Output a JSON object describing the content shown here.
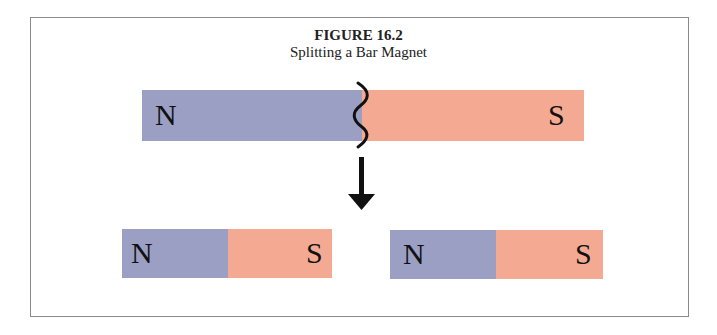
{
  "figure": {
    "title": "FIGURE 16.2",
    "subtitle": "Splitting a Bar Magnet"
  },
  "top_magnet": {
    "north_label": "N",
    "south_label": "S",
    "north_color": "#9b9fc4",
    "south_color": "#f4aa92",
    "split_mark": "wavy-break-line"
  },
  "arrow": {
    "direction": "down"
  },
  "bottom_magnets": [
    {
      "north_label": "N",
      "south_label": "S"
    },
    {
      "north_label": "N",
      "south_label": "S"
    }
  ]
}
